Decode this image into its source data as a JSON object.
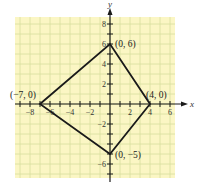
{
  "chart_data": {
    "type": "line",
    "title": "",
    "xlabel": "x",
    "ylabel": "y",
    "xlim": [
      -9.5,
      6.5
    ],
    "ylim": [
      -7.4,
      8.7
    ],
    "grid": true,
    "x_ticks": [
      -8,
      -6,
      -4,
      -2,
      2,
      4,
      6
    ],
    "y_ticks": [
      8,
      6,
      4,
      2,
      -2,
      -6
    ],
    "series": [
      {
        "name": "quadrilateral",
        "closed": true,
        "points": [
          {
            "x": -7,
            "y": 0,
            "label": "(−7, 0)"
          },
          {
            "x": 0,
            "y": 6,
            "label": "(0, 6)"
          },
          {
            "x": 4,
            "y": 0,
            "label": "(4, 0)"
          },
          {
            "x": 0,
            "y": -5,
            "label": "(0, −5)"
          }
        ]
      }
    ],
    "colors": {
      "grid_background": "#fbf6c4",
      "grid_line": "#d8dfa0",
      "polygon": "#1a1a1a",
      "axis": "#1a1a1a"
    }
  }
}
